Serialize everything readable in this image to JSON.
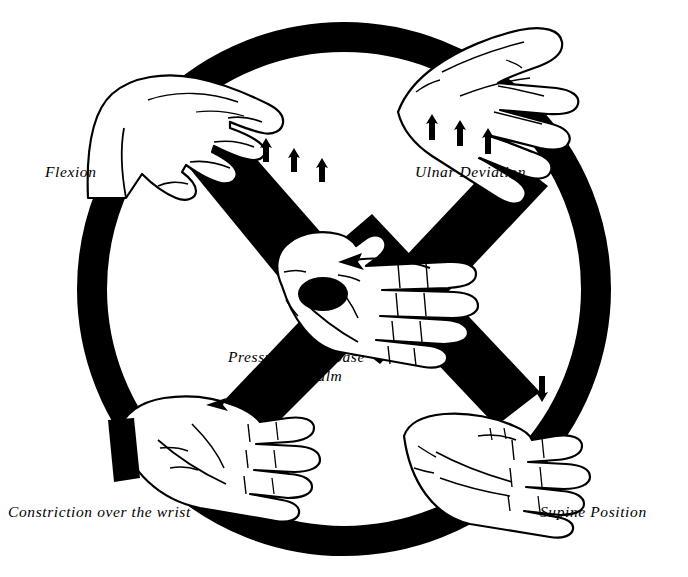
{
  "figure": {
    "background_color": "#ffffff",
    "ink_color": "#000000",
    "ring": {
      "center_x": 344,
      "center_y": 289,
      "radius": 252,
      "stroke_width": 30
    },
    "labels": {
      "flexion": "Flexion",
      "ulnar_deviation": "Ulnar Deviation",
      "pressure_line1": "Pressure at the base",
      "pressure_line2": "of the palm",
      "constriction": "Constriction over the wrist",
      "supine": "Supine Position"
    },
    "arrow_groups": [
      {
        "name": "flexion-arrows",
        "direction": "down",
        "count": 3
      },
      {
        "name": "ulnar-arrows",
        "direction": "down",
        "count": 3
      },
      {
        "name": "supine-arrows",
        "direction": "up",
        "count": 3
      }
    ],
    "hands": [
      {
        "name": "hand-flexion",
        "position": "top-left",
        "view": "lateral-flexed"
      },
      {
        "name": "hand-ulnar-deviation",
        "position": "top-right",
        "view": "dorsal-deviated"
      },
      {
        "name": "hand-pressure-palm",
        "position": "center",
        "view": "palmar"
      },
      {
        "name": "hand-constriction",
        "position": "bottom-left",
        "view": "palmar-with-cuff"
      },
      {
        "name": "hand-supine",
        "position": "bottom-right",
        "view": "supine"
      }
    ],
    "markers": {
      "pressure_spot": {
        "name": "pressure-spot",
        "shape": "ellipse",
        "fill": "#000000"
      },
      "wrist_cuff": {
        "name": "wrist-cuff-band",
        "shape": "band",
        "fill": "#000000"
      }
    }
  }
}
